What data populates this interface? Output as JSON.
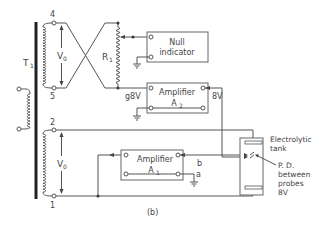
{
  "diagram": {
    "caption": "(b)",
    "transformer": {
      "label": "T",
      "label_sub": "1",
      "terminals": {
        "t4": "4",
        "t5": "5",
        "t2": "2",
        "t1": "1"
      },
      "top_voltage": "V",
      "top_voltage_sub": "0",
      "bottom_voltage": "V",
      "bottom_voltage_sub": "0"
    },
    "resistor": {
      "label": "R",
      "label_sub": "1"
    },
    "null_indicator": {
      "line1": "Null",
      "line2": "indicator"
    },
    "amplifier_a2": {
      "line1": "Amplifier",
      "line2": "A",
      "line2_sub": "2",
      "input_label": "g8V",
      "output_label": "8V"
    },
    "amplifier_a1": {
      "line1": "Amplifier",
      "line2": "A",
      "line2_sub": "1",
      "terminal_b": "b",
      "terminal_a": "a"
    },
    "tank": {
      "line1": "Electrolytic",
      "line2": "tank",
      "pd_line1": "P. D.",
      "pd_line2": "between",
      "pd_line3": "probes",
      "pd_line4": "8V"
    }
  }
}
